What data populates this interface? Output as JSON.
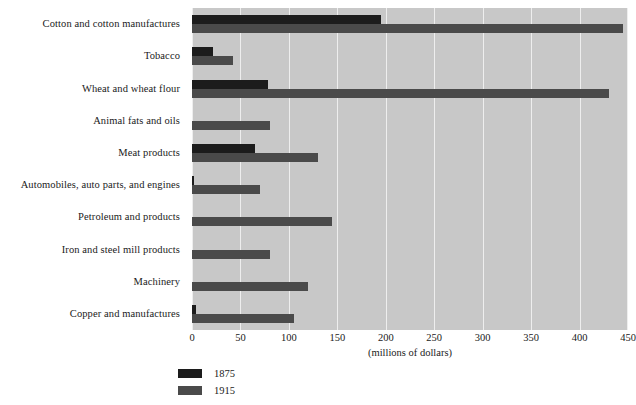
{
  "chart_data": {
    "type": "bar",
    "orientation": "horizontal",
    "title": "",
    "xlabel": "(millions of dollars)",
    "ylabel": "",
    "xlim": [
      0,
      450
    ],
    "xticks": [
      0,
      50,
      100,
      150,
      200,
      250,
      300,
      350,
      400,
      450
    ],
    "grid": true,
    "legend_position": "below-left",
    "categories": [
      "Cotton and cotton manufactures",
      "Tobacco",
      "Wheat and wheat flour",
      "Animal fats and oils",
      "Meat products",
      "Automobiles, auto parts, and engines",
      "Petroleum and products",
      "Iron and steel mill products",
      "Machinery",
      "Copper and manufactures"
    ],
    "series": [
      {
        "name": "1875",
        "color": "#1c1c1c",
        "values": [
          195,
          22,
          78,
          0,
          65,
          2,
          0,
          0,
          0,
          4
        ]
      },
      {
        "name": "1915",
        "color": "#4a4a4a",
        "values": [
          445,
          42,
          430,
          80,
          130,
          70,
          145,
          80,
          120,
          105
        ]
      }
    ]
  },
  "plot": {
    "background_color": "#c8c8c8",
    "gridline_color": "#eeeeee"
  },
  "legend": {
    "entries": [
      {
        "label": "1875",
        "color": "#1c1c1c"
      },
      {
        "label": "1915",
        "color": "#4a4a4a"
      }
    ]
  }
}
